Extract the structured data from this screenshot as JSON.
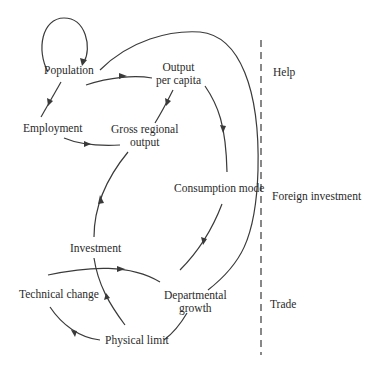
{
  "diagram": {
    "type": "causal-loop",
    "nodes": {
      "population": "Population",
      "output_per_capita_1": "Output",
      "output_per_capita_2": "per capita",
      "employment": "Employment",
      "gross_regional_output_1": "Gross regional",
      "gross_regional_output_2": "output",
      "consumption_mode": "Consumption mode",
      "investment": "Investment",
      "technical_change": "Technical change",
      "departmental_growth_1": "Departmental",
      "departmental_growth_2": "growth",
      "physical_limit": "Physical limit"
    },
    "external_factors": {
      "help": "Help",
      "foreign_investment": "Foreign investment",
      "trade": "Trade"
    },
    "edges": [
      {
        "from": "Population",
        "to": "Population",
        "style": "self-loop"
      },
      {
        "from": "Population",
        "to": "Employment"
      },
      {
        "from": "Population",
        "to": "Output per capita"
      },
      {
        "from": "Employment",
        "to": "Gross regional output"
      },
      {
        "from": "Gross regional output",
        "to": "Output per capita"
      },
      {
        "from": "Output per capita",
        "to": "Consumption mode"
      },
      {
        "from": "Consumption mode",
        "to": "Departmental growth"
      },
      {
        "from": "Departmental growth",
        "to": "Population",
        "style": "large-arc"
      },
      {
        "from": "Investment",
        "to": "Gross regional output"
      },
      {
        "from": "Technical change",
        "to": "Departmental growth",
        "via": "Investment"
      },
      {
        "from": "Physical limit",
        "to": "Investment"
      },
      {
        "from": "Physical limit",
        "to": "Technical change"
      },
      {
        "from": "Departmental growth",
        "to": "Physical limit"
      }
    ],
    "colors": {
      "stroke": "#3a3a3a",
      "text": "#2a2a2a",
      "background": "#ffffff"
    }
  }
}
